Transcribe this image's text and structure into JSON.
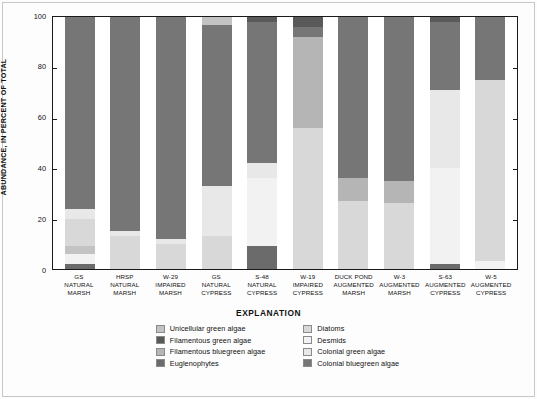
{
  "chart_data": {
    "type": "bar",
    "subtype": "stacked-percent",
    "title": "",
    "xlabel": "",
    "ylabel": "ABUNDANCE, IN PERCENT OF TOTAL",
    "ylim": [
      0,
      100
    ],
    "yticks": [
      0,
      20,
      40,
      60,
      80,
      100
    ],
    "grid": false,
    "legend_position": "bottom",
    "legend_title": "EXPLANATION",
    "categories": [
      "GS NATURAL MARSH",
      "HRSP NATURAL MARSH",
      "W-29 IMPAIRED MARSH",
      "GS NATURAL CYPRESS",
      "S-48 NATURAL CYPRESS",
      "W-19 IMPAIRED CYPRESS",
      "DUCK POND AUGMENTED MARSH",
      "W-3 AUGMENTED MARSH",
      "S-63 AUGMENTED CYPRESS",
      "W-5 AUGMENTED CYPRESS"
    ],
    "category_lines": [
      [
        "GS",
        "NATURAL",
        "MARSH"
      ],
      [
        "HRSP",
        "NATURAL",
        "MARSH"
      ],
      [
        "W-29",
        "IMPAIRED",
        "MARSH"
      ],
      [
        "GS",
        "NATURAL",
        "CYPRESS"
      ],
      [
        "S-48",
        "NATURAL",
        "CYPRESS"
      ],
      [
        "W-19",
        "IMPAIRED",
        "CYPRESS"
      ],
      [
        "DUCK POND",
        "AUGMENTED",
        "MARSH"
      ],
      [
        "W-3",
        "AUGMENTED",
        "MARSH"
      ],
      [
        "S-63",
        "AUGMENTED",
        "CYPRESS"
      ],
      [
        "W-5",
        "AUGMENTED",
        "CYPRESS"
      ]
    ],
    "series": [
      {
        "name": "Euglenophytes",
        "color": "#6b6b6b",
        "values": [
          2,
          0,
          0,
          0,
          9,
          0,
          0,
          0,
          2,
          0
        ]
      },
      {
        "name": "Filamentous green algae",
        "color": "#595959",
        "values": [
          0,
          0,
          0,
          0,
          0,
          0,
          0,
          0,
          0,
          0
        ]
      },
      {
        "name": "Desmids",
        "color": "#f2f2f2",
        "values": [
          4,
          0,
          0,
          0,
          27,
          0,
          0,
          0,
          38,
          3
        ]
      },
      {
        "name": "Unicellular green algae",
        "color": "#c3c3c3",
        "values": [
          3,
          0,
          0,
          0,
          0,
          0,
          0,
          0,
          0,
          0
        ]
      },
      {
        "name": "Diatoms",
        "color": "#d8d8d8",
        "values": [
          11,
          13,
          10,
          13,
          0,
          56,
          27,
          26,
          0,
          72
        ]
      },
      {
        "name": "Colonial green algae",
        "color": "#e8e8e8",
        "values": [
          4,
          2,
          2,
          20,
          6,
          0,
          0,
          0,
          31,
          0
        ]
      },
      {
        "name": "Filamentous bluegreen algae",
        "color": "#b5b5b5",
        "values": [
          0,
          0,
          0,
          0,
          0,
          36,
          9,
          9,
          0,
          0
        ]
      },
      {
        "name": "Colonial bluegreen algae",
        "color": "#767676",
        "values": [
          76,
          85,
          88,
          64,
          56,
          4,
          64,
          65,
          27,
          25
        ]
      },
      {
        "name": "Filamentous green algae (top)",
        "color": "#595959",
        "values": [
          0,
          0,
          0,
          0,
          2,
          4,
          0,
          0,
          2,
          0
        ]
      },
      {
        "name": "Unicellular green algae (top)",
        "color": "#c3c3c3",
        "values": [
          0,
          0,
          0,
          3,
          0,
          0,
          0,
          0,
          0,
          0
        ]
      }
    ]
  },
  "axis": {
    "y_title": "ABUNDANCE, IN PERCENT OF TOTAL",
    "ticks": [
      "100",
      "80",
      "60",
      "40",
      "20",
      "0"
    ]
  },
  "legend": {
    "title": "EXPLANATION",
    "left_column": [
      {
        "label": "Unicellular green algae",
        "color": "#c3c3c3"
      },
      {
        "label": "Filamentous green algae",
        "color": "#595959"
      },
      {
        "label": "Filamentous bluegreen algae",
        "color": "#b5b5b5"
      },
      {
        "label": "Euglenophytes",
        "color": "#6b6b6b"
      }
    ],
    "right_column": [
      {
        "label": "Diatoms",
        "color": "#d8d8d8"
      },
      {
        "label": "Desmids",
        "color": "#f2f2f2"
      },
      {
        "label": "Colonial green algae",
        "color": "#e8e8e8"
      },
      {
        "label": "Colonial bluegreen algae",
        "color": "#767676"
      }
    ]
  }
}
